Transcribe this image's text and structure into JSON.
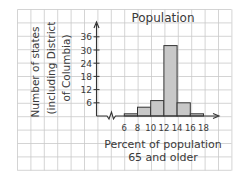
{
  "chart_data": {
    "type": "bar",
    "subtype": "histogram",
    "title": "Population",
    "xlabel": "Percent of population 65 and older",
    "xlabel_lines": [
      "Percent of population",
      "65 and older"
    ],
    "ylabel": "Number of states (including District of Columbia)",
    "ylabel_lines": [
      "Number of states",
      "(including District",
      "of Columbia)"
    ],
    "x_ticks": [
      "6",
      "8",
      "10",
      "12",
      "14",
      "16",
      "18"
    ],
    "y_ticks": [
      "6",
      "12",
      "18",
      "24",
      "30",
      "36"
    ],
    "categories": [
      "6-8",
      "8-10",
      "10-12",
      "12-14",
      "14-16",
      "16-18"
    ],
    "bins": [
      [
        6,
        8
      ],
      [
        8,
        10
      ],
      [
        10,
        12
      ],
      [
        12,
        14
      ],
      [
        14,
        16
      ],
      [
        16,
        18
      ]
    ],
    "values": [
      1,
      4,
      7,
      32,
      6,
      1
    ],
    "ylim": [
      0,
      38
    ],
    "grid": true,
    "axis_break": true,
    "bar_fill": "#c8c8c8",
    "bar_edge": "#333333",
    "grid_color": "#c9c9c9"
  }
}
